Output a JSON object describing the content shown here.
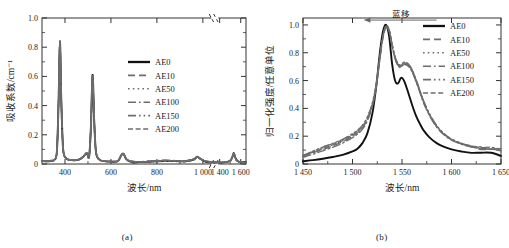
{
  "figure": {
    "panels": [
      {
        "caption": "(a)",
        "axes": {
          "xlabel": "波长/nm",
          "ylabel": "吸收系数/cm⁻¹",
          "xticks": [
            "400",
            "600",
            "800",
            "1 000",
            "1 400",
            "1 600"
          ],
          "yticks": [
            "0",
            "0.2",
            "0.4",
            "0.6",
            "0.8",
            "1.0"
          ],
          "axis_break": true
        },
        "legend": [
          {
            "label": "AE0",
            "style": "solid"
          },
          {
            "label": "AE10",
            "style": "dashed"
          },
          {
            "label": "AE50",
            "style": "dotted"
          },
          {
            "label": "AE100",
            "style": "dashdot"
          },
          {
            "label": "AE150",
            "style": "dashdotdot"
          },
          {
            "label": "AE200",
            "style": "dashed2"
          }
        ]
      },
      {
        "caption": "(b)",
        "axes": {
          "xlabel": "波长/nm",
          "ylabel": "归一化强度/任意单位",
          "xticks": [
            "1 450",
            "1 500",
            "1 550",
            "1 600",
            "1 650"
          ],
          "yticks": [
            "0",
            "0.2",
            "0.4",
            "0.6",
            "0.8",
            "1.0"
          ],
          "axis_break": false
        },
        "annotation": {
          "text": "蓝移",
          "arrow": "left"
        },
        "legend": [
          {
            "label": "AE0",
            "style": "solid"
          },
          {
            "label": "AE10",
            "style": "dashed"
          },
          {
            "label": "AE50",
            "style": "dotted"
          },
          {
            "label": "AE100",
            "style": "dashdot"
          },
          {
            "label": "AE150",
            "style": "dashdotdot"
          },
          {
            "label": "AE200",
            "style": "dashed2"
          }
        ]
      }
    ]
  },
  "chart_data": [
    {
      "type": "line",
      "title": "",
      "xlabel": "波长/nm",
      "ylabel": "吸收系数/cm⁻¹",
      "xlim": [
        300,
        1650
      ],
      "ylim": [
        0,
        1.0
      ],
      "grid": false,
      "legend_position": "center-right",
      "axis_break": {
        "from": 1050,
        "to": 1350
      },
      "x": [
        300,
        320,
        340,
        355,
        365,
        372,
        378,
        384,
        392,
        405,
        420,
        440,
        460,
        480,
        495,
        505,
        513,
        520,
        527,
        535,
        550,
        570,
        600,
        630,
        645,
        655,
        668,
        690,
        720,
        760,
        800,
        840,
        880,
        920,
        960,
        975,
        990,
        1010,
        1030,
        1050,
        1400,
        1440,
        1480,
        1505,
        1525,
        1535,
        1545,
        1560,
        1590,
        1620,
        1650
      ],
      "series": [
        {
          "name": "AE0",
          "values": [
            0.02,
            0.018,
            0.022,
            0.03,
            0.09,
            0.42,
            0.84,
            0.43,
            0.1,
            0.04,
            0.028,
            0.025,
            0.03,
            0.05,
            0.075,
            0.05,
            0.26,
            0.61,
            0.3,
            0.08,
            0.03,
            0.02,
            0.016,
            0.02,
            0.06,
            0.068,
            0.03,
            0.016,
            0.014,
            0.016,
            0.02,
            0.022,
            0.02,
            0.018,
            0.03,
            0.05,
            0.034,
            0.018,
            0.014,
            0.012,
            0.01,
            0.012,
            0.016,
            0.026,
            0.055,
            0.072,
            0.05,
            0.026,
            0.014,
            0.012,
            0.01
          ]
        },
        {
          "name": "AE10",
          "values": [
            0.021,
            0.019,
            0.023,
            0.031,
            0.092,
            0.425,
            0.838,
            0.432,
            0.102,
            0.041,
            0.029,
            0.026,
            0.031,
            0.051,
            0.076,
            0.051,
            0.262,
            0.606,
            0.302,
            0.081,
            0.031,
            0.021,
            0.017,
            0.021,
            0.061,
            0.069,
            0.031,
            0.017,
            0.015,
            0.017,
            0.021,
            0.023,
            0.021,
            0.019,
            0.031,
            0.051,
            0.035,
            0.019,
            0.015,
            0.013,
            0.011,
            0.013,
            0.017,
            0.027,
            0.056,
            0.073,
            0.051,
            0.027,
            0.015,
            0.013,
            0.011
          ]
        },
        {
          "name": "AE50",
          "values": [
            0.019,
            0.017,
            0.021,
            0.029,
            0.088,
            0.418,
            0.842,
            0.428,
            0.099,
            0.039,
            0.027,
            0.024,
            0.029,
            0.049,
            0.074,
            0.049,
            0.258,
            0.612,
            0.298,
            0.079,
            0.029,
            0.019,
            0.015,
            0.019,
            0.059,
            0.067,
            0.029,
            0.015,
            0.013,
            0.015,
            0.019,
            0.021,
            0.019,
            0.017,
            0.029,
            0.049,
            0.033,
            0.017,
            0.013,
            0.011,
            0.009,
            0.011,
            0.015,
            0.025,
            0.054,
            0.071,
            0.049,
            0.025,
            0.013,
            0.011,
            0.009
          ]
        },
        {
          "name": "AE100",
          "values": [
            0.022,
            0.02,
            0.024,
            0.032,
            0.094,
            0.43,
            0.836,
            0.434,
            0.104,
            0.042,
            0.03,
            0.027,
            0.032,
            0.052,
            0.077,
            0.052,
            0.264,
            0.604,
            0.304,
            0.082,
            0.032,
            0.022,
            0.018,
            0.022,
            0.062,
            0.07,
            0.032,
            0.018,
            0.016,
            0.018,
            0.022,
            0.024,
            0.022,
            0.02,
            0.032,
            0.052,
            0.036,
            0.02,
            0.016,
            0.014,
            0.012,
            0.014,
            0.018,
            0.028,
            0.057,
            0.074,
            0.052,
            0.028,
            0.016,
            0.014,
            0.012
          ]
        },
        {
          "name": "AE150",
          "values": [
            0.02,
            0.018,
            0.022,
            0.03,
            0.09,
            0.422,
            0.844,
            0.43,
            0.101,
            0.04,
            0.028,
            0.025,
            0.03,
            0.05,
            0.075,
            0.05,
            0.261,
            0.608,
            0.301,
            0.08,
            0.03,
            0.02,
            0.016,
            0.02,
            0.06,
            0.068,
            0.03,
            0.016,
            0.014,
            0.016,
            0.02,
            0.022,
            0.02,
            0.018,
            0.03,
            0.05,
            0.034,
            0.018,
            0.014,
            0.012,
            0.01,
            0.012,
            0.016,
            0.026,
            0.055,
            0.072,
            0.05,
            0.026,
            0.014,
            0.012,
            0.01
          ]
        },
        {
          "name": "AE200",
          "values": [
            0.021,
            0.019,
            0.023,
            0.031,
            0.091,
            0.424,
            0.839,
            0.431,
            0.103,
            0.041,
            0.029,
            0.026,
            0.031,
            0.051,
            0.076,
            0.051,
            0.263,
            0.607,
            0.303,
            0.081,
            0.031,
            0.021,
            0.017,
            0.021,
            0.061,
            0.069,
            0.031,
            0.017,
            0.015,
            0.017,
            0.021,
            0.023,
            0.021,
            0.019,
            0.031,
            0.051,
            0.035,
            0.019,
            0.015,
            0.013,
            0.011,
            0.013,
            0.017,
            0.027,
            0.056,
            0.073,
            0.051,
            0.027,
            0.015,
            0.013,
            0.011
          ]
        }
      ],
      "peaks": [
        {
          "wavelength": 378,
          "height": 0.84
        },
        {
          "wavelength": 520,
          "height": 0.61
        },
        {
          "wavelength": 650,
          "height": 0.07
        },
        {
          "wavelength": 978,
          "height": 0.05
        },
        {
          "wavelength": 1535,
          "height": 0.07
        }
      ]
    },
    {
      "type": "line",
      "title": "",
      "xlabel": "波长/nm",
      "ylabel": "归一化强度/任意单位",
      "xlim": [
        1450,
        1650
      ],
      "ylim": [
        0,
        1.05
      ],
      "grid": false,
      "legend_position": "top-right",
      "annotation": {
        "text": "蓝移",
        "x": 1540,
        "y": 1.02,
        "arrow_direction": "left"
      },
      "x": [
        1450,
        1460,
        1470,
        1480,
        1490,
        1500,
        1505,
        1510,
        1515,
        1520,
        1524,
        1528,
        1531,
        1534,
        1537,
        1540,
        1543,
        1546,
        1549,
        1552,
        1556,
        1560,
        1564,
        1568,
        1572,
        1578,
        1585,
        1592,
        1600,
        1610,
        1620,
        1630,
        1640,
        1650
      ],
      "series": [
        {
          "name": "AE0",
          "values": [
            0.02,
            0.028,
            0.038,
            0.05,
            0.065,
            0.09,
            0.11,
            0.15,
            0.22,
            0.36,
            0.56,
            0.82,
            0.96,
            1.0,
            0.92,
            0.72,
            0.6,
            0.58,
            0.62,
            0.6,
            0.52,
            0.43,
            0.35,
            0.29,
            0.24,
            0.19,
            0.15,
            0.125,
            0.105,
            0.09,
            0.08,
            0.075,
            0.072,
            0.07
          ]
        },
        {
          "name": "AE10",
          "values": [
            0.055,
            0.08,
            0.105,
            0.13,
            0.16,
            0.2,
            0.225,
            0.26,
            0.32,
            0.42,
            0.56,
            0.78,
            0.92,
            0.985,
            0.96,
            0.85,
            0.76,
            0.71,
            0.7,
            0.72,
            0.71,
            0.67,
            0.6,
            0.52,
            0.44,
            0.35,
            0.27,
            0.215,
            0.175,
            0.145,
            0.125,
            0.112,
            0.105,
            0.1
          ]
        },
        {
          "name": "AE50",
          "values": [
            0.06,
            0.09,
            0.12,
            0.145,
            0.175,
            0.215,
            0.24,
            0.275,
            0.335,
            0.435,
            0.575,
            0.79,
            0.93,
            0.99,
            0.965,
            0.86,
            0.77,
            0.72,
            0.71,
            0.73,
            0.72,
            0.68,
            0.61,
            0.53,
            0.45,
            0.355,
            0.275,
            0.22,
            0.178,
            0.148,
            0.128,
            0.115,
            0.108,
            0.102
          ]
        },
        {
          "name": "AE100",
          "values": [
            0.048,
            0.07,
            0.095,
            0.12,
            0.15,
            0.19,
            0.215,
            0.25,
            0.31,
            0.41,
            0.55,
            0.77,
            0.915,
            0.98,
            0.955,
            0.845,
            0.755,
            0.705,
            0.695,
            0.715,
            0.705,
            0.665,
            0.595,
            0.515,
            0.435,
            0.345,
            0.265,
            0.212,
            0.172,
            0.142,
            0.122,
            0.11,
            0.103,
            0.098
          ]
        },
        {
          "name": "AE150",
          "values": [
            0.062,
            0.092,
            0.122,
            0.148,
            0.178,
            0.218,
            0.243,
            0.278,
            0.338,
            0.438,
            0.578,
            0.795,
            0.935,
            0.995,
            0.968,
            0.862,
            0.772,
            0.722,
            0.712,
            0.732,
            0.722,
            0.682,
            0.612,
            0.532,
            0.452,
            0.358,
            0.278,
            0.222,
            0.18,
            0.15,
            0.13,
            0.117,
            0.11,
            0.105
          ]
        },
        {
          "name": "AE200",
          "values": [
            0.058,
            0.085,
            0.112,
            0.138,
            0.168,
            0.208,
            0.232,
            0.268,
            0.328,
            0.428,
            0.568,
            0.788,
            0.928,
            0.992,
            0.962,
            0.856,
            0.766,
            0.716,
            0.706,
            0.726,
            0.716,
            0.676,
            0.606,
            0.526,
            0.446,
            0.352,
            0.272,
            0.218,
            0.176,
            0.146,
            0.126,
            0.114,
            0.106,
            0.101
          ]
        }
      ],
      "peaks": [
        {
          "series": "AE0",
          "wavelength": 1535,
          "height": 1.0
        },
        {
          "series": "AE0",
          "wavelength": 1549,
          "height": 0.62
        },
        {
          "series": "AE150",
          "wavelength": 1533,
          "height": 1.0
        }
      ]
    }
  ]
}
